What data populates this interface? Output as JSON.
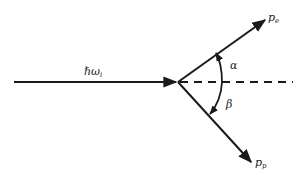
{
  "diagram": {
    "type": "scattering-vector-diagram",
    "colors": {
      "line": "#1a1a1a",
      "text": "#222222",
      "background": "#ffffff"
    },
    "incident": {
      "label_main": "ℏω",
      "label_sub": "i"
    },
    "outgoing_upper": {
      "label_main": "p",
      "label_sub": "e"
    },
    "outgoing_lower": {
      "label_main": "p",
      "label_sub": "p"
    },
    "angles": {
      "alpha": "α",
      "beta": "β"
    }
  }
}
